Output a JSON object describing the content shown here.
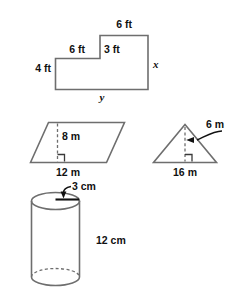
{
  "worksheet": {
    "title": "Geometric figures with dimension labels",
    "stroke_color": "#6e6e6e",
    "label_color": "#111111"
  },
  "figures": [
    {
      "id": "l-shape",
      "name": "composite-rectangle-l-shape",
      "shape": "L-shaped polygon",
      "unit": "ft",
      "labels": {
        "top_right": "6 ft",
        "top_left": "6 ft",
        "step_vertical": "3 ft",
        "left_vertical": "4 ft",
        "right_vertical": "x",
        "bottom": "y"
      }
    },
    {
      "id": "parallelogram",
      "name": "parallelogram",
      "shape": "parallelogram",
      "unit": "m",
      "labels": {
        "height": "8 m",
        "base": "12 m"
      }
    },
    {
      "id": "triangle",
      "name": "triangle",
      "shape": "triangle",
      "unit": "m",
      "labels": {
        "height": "6 m",
        "base": "16 m"
      }
    },
    {
      "id": "cylinder",
      "name": "cylinder",
      "shape": "cylinder",
      "unit": "cm",
      "labels": {
        "radius": "3 cm",
        "height": "12 cm"
      }
    }
  ]
}
